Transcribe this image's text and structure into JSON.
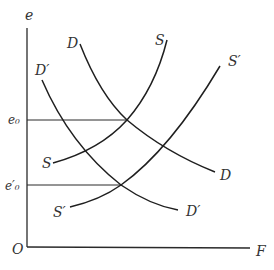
{
  "diagram": {
    "title": "",
    "axes": {
      "y_label": "e",
      "x_label": "F",
      "origin_label": "O"
    },
    "levels": [
      {
        "label": "e₀",
        "name": "e0",
        "y": 120
      },
      {
        "label": "e′₀",
        "name": "e-prime-0",
        "y": 185
      }
    ],
    "curves": [
      {
        "name": "D",
        "label": "D",
        "type": "demand"
      },
      {
        "name": "D-prime",
        "label": "D′",
        "type": "demand"
      },
      {
        "name": "S",
        "label": "S",
        "type": "supply"
      },
      {
        "name": "S-prime",
        "label": "S′",
        "type": "supply"
      }
    ],
    "labels": {
      "D_top": "D",
      "D_bottom": "D",
      "Dp_top": "D′",
      "Dp_bottom": "D′",
      "S_top": "S",
      "S_bottom": "S",
      "Sp_top": "S′",
      "Sp_bottom": "S′"
    },
    "colors": {
      "line": "#1f1f1f",
      "text": "#333333",
      "background": "#ffffff"
    }
  }
}
